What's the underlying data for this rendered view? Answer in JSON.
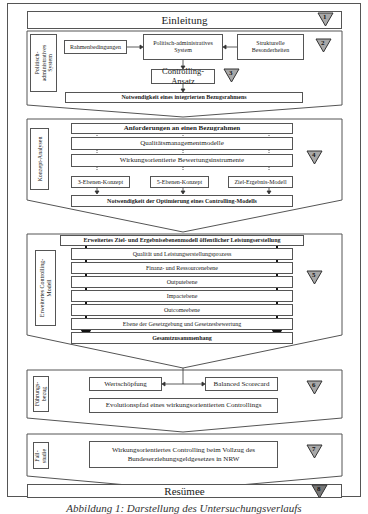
{
  "sections": {
    "s1": {
      "title": "Einleitung",
      "number": "1"
    },
    "s2": {
      "side_label": "Politisch-\nadministratives\nSystem",
      "rahmen": "Rahmenbedingungen",
      "system": "Politisch-administratives\nSystem",
      "strukturelle": "Strukturelle\nBesonderheiten",
      "controlling": "Controlling-Ansatz",
      "notwendigkeit": "Notwendigkeit eines integrierten Bezugsrahmens",
      "number": "2",
      "number_sub": "3"
    },
    "s4": {
      "side_label": "Konzept-Analysen",
      "anforderungen": "Anforderungen an einen Bezugrahmen",
      "qualitaet": "Qualitätsmanagementmodelle",
      "wirkung": "Wirkungsorientierte Bewertungsinstrumente",
      "konzept3": "3-Ebenen-Konzept",
      "konzept5": "5-Ebenen-Konzept",
      "ziel": "Ziel-Ergebnis-Modell",
      "notwendigkeit": "Notwendigkeit der Optimierung eines Controlling-Modells",
      "number": "4"
    },
    "s5": {
      "side_label": "Erweitertes Controlling-\nModell",
      "header": "Erweitertes Ziel- und Ergebnisebenenmodell öffentlicher Leistungserstellung",
      "levels": [
        "Qualität und Leistungserstellungsprozess",
        "Finanz- und Ressourcenebene",
        "Outputebene",
        "Impactebene",
        "Outcomeebene",
        "Ebene der Gesetzgebung und Gesetzesbewertung",
        "Gesamtzusammenhang"
      ],
      "number": "5"
    },
    "s6": {
      "side_label": "Führungs-\nbezug",
      "wertschoepfung": "Wertschöpfung",
      "bsc": "Balanced Scorecard",
      "evolution": "Evolutionspfad eines wirkungsorientierten Controllings",
      "number": "6"
    },
    "s7": {
      "side_label": "Fall-\nstudie",
      "text": "Wirkungsorientiertes Controlling beim Vollzug des\nBundeserziehungsgeldgesetzes in NRW",
      "number": "7"
    },
    "s8": {
      "title": "Resümee",
      "number": "8"
    }
  },
  "caption": "Abbildung 1: Darstellung des Untersuchungsverlaufs",
  "colors": {
    "line": "#555555",
    "badge_fill": "#a8a8a8",
    "badge_stroke": "#333333"
  }
}
